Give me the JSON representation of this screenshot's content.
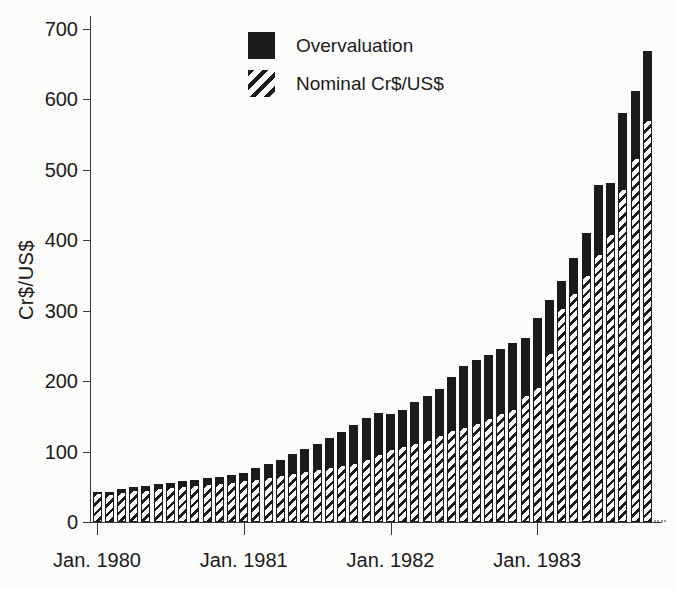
{
  "figure": {
    "background": "#fcfcfb",
    "text_color": "#1a1a1a"
  },
  "legend": {
    "items": [
      {
        "label": "Overvaluation",
        "swatch": "solid-black-square-icon"
      },
      {
        "label": "Nominal Cr$/US$",
        "swatch": "diagonal-hatch-square-icon"
      }
    ],
    "position": "top-center"
  },
  "chart_data": {
    "type": "bar",
    "stacked": true,
    "title": "",
    "xlabel": "",
    "ylabel": "Cr$/US$",
    "ylim": [
      0,
      700
    ],
    "yticks": [
      0,
      100,
      200,
      300,
      400,
      500,
      600,
      700
    ],
    "xticks": [
      {
        "index": 0,
        "label": "Jan. 1980"
      },
      {
        "index": 12,
        "label": "Jan. 1981"
      },
      {
        "index": 24,
        "label": "Jan. 1982"
      },
      {
        "index": 36,
        "label": "Jan. 1983"
      }
    ],
    "grid": false,
    "legend_position": "top-center",
    "x": [
      "Jan 1980",
      "Feb 1980",
      "Mar 1980",
      "Apr 1980",
      "May 1980",
      "Jun 1980",
      "Jul 1980",
      "Aug 1980",
      "Sep 1980",
      "Oct 1980",
      "Nov 1980",
      "Dec 1980",
      "Jan 1981",
      "Feb 1981",
      "Mar 1981",
      "Apr 1981",
      "May 1981",
      "Jun 1981",
      "Jul 1981",
      "Aug 1981",
      "Sep 1981",
      "Oct 1981",
      "Nov 1981",
      "Dec 1981",
      "Jan 1982",
      "Feb 1982",
      "Mar 1982",
      "Apr 1982",
      "May 1982",
      "Jun 1982",
      "Jul 1982",
      "Aug 1982",
      "Sep 1982",
      "Oct 1982",
      "Nov 1982",
      "Dec 1982",
      "Jan 1983",
      "Feb 1983",
      "Mar 1983",
      "Apr 1983",
      "May 1983",
      "Jun 1983",
      "Jul 1983",
      "Aug 1983",
      "Sep 1983",
      "Oct 1983"
    ],
    "series": [
      {
        "name": "Nominal Cr$/US$",
        "color": "#fdfdfd",
        "pattern": "diagonal-hatch",
        "values": [
          41,
          40,
          43,
          45,
          46,
          48,
          49,
          51,
          52,
          54,
          55,
          57,
          59,
          61,
          64,
          67,
          70,
          72,
          75,
          78,
          81,
          84,
          89,
          96,
          103,
          108,
          112,
          117,
          123,
          130,
          135,
          140,
          147,
          155,
          160,
          180,
          192,
          240,
          303,
          325,
          350,
          380,
          408,
          472,
          516,
          570
        ]
      },
      {
        "name": "Overvaluation",
        "color": "#1b1b1b",
        "pattern": "solid",
        "values": [
          1,
          3,
          4,
          4,
          5,
          6,
          7,
          7,
          8,
          8,
          9,
          10,
          11,
          15,
          18,
          21,
          26,
          32,
          36,
          41,
          47,
          54,
          59,
          59,
          50,
          51,
          58,
          62,
          65,
          75,
          86,
          90,
          90,
          91,
          94,
          81,
          97,
          75,
          39,
          49,
          60,
          98,
          73,
          108,
          96,
          98
        ]
      }
    ],
    "colors": {
      "bar_black": "#1b1b1b",
      "hatch_stripe": "#1b1b1b",
      "hatch_background": "#fdfdfd",
      "axis": "#3a3a3a"
    }
  }
}
